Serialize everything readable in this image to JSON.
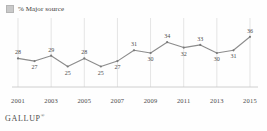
{
  "legend": {
    "swatch_name": "legend-swatch",
    "label": "% Major source",
    "swatch_color": "#c9c9c9"
  },
  "footer": {
    "brand": "GALLUP",
    "trademark": "®"
  },
  "colors": {
    "line": "#8c8c8c",
    "marker": "#7a7a7a",
    "gridline": "#d8d8d8",
    "axis": "#c4c4c4",
    "text": "#4a4a4a",
    "background": "#fefefe"
  },
  "chart_data": {
    "type": "line",
    "title": "",
    "subtitle": "",
    "xlabel": "",
    "ylabel": "",
    "legend_position": "top-left",
    "grid": "vertical-only",
    "ylim": [
      20,
      40
    ],
    "xlim": [
      2001,
      2015
    ],
    "x": [
      2001,
      2002,
      2003,
      2004,
      2005,
      2006,
      2007,
      2008,
      2009,
      2010,
      2011,
      2012,
      2013,
      2014,
      2015
    ],
    "xtick_labels": [
      "2001",
      "2003",
      "2005",
      "2007",
      "2009",
      "2011",
      "2013",
      "2015"
    ],
    "xticks": [
      2001,
      2003,
      2005,
      2007,
      2009,
      2011,
      2013,
      2015
    ],
    "series": [
      {
        "name": "% Major source",
        "values": [
          28,
          27,
          29,
          25,
          28,
          25,
          27,
          31,
          30,
          34,
          32,
          33,
          30,
          31,
          36
        ],
        "labels": [
          "28",
          "27",
          "29",
          "25",
          "28",
          "25",
          "27",
          "31",
          "30",
          "34",
          "32",
          "33",
          "30",
          "31",
          "36"
        ],
        "label_positions": [
          "above",
          "below",
          "above",
          "below",
          "above",
          "below",
          "below",
          "above",
          "below",
          "above",
          "below",
          "above",
          "below",
          "below",
          "above"
        ]
      }
    ]
  }
}
